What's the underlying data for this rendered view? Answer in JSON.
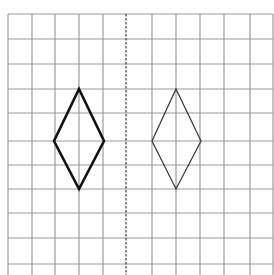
{
  "diagram": {
    "type": "grid-symmetry",
    "colors": {
      "grid": "#9a9a9a",
      "axis": "#555555",
      "shape_bold": "#111111",
      "shape_thin": "#333333",
      "background": "#ffffff"
    },
    "grid": {
      "columns_x": [
        8,
        32,
        55,
        79,
        103,
        126,
        152,
        176,
        200,
        224,
        250,
        273
      ],
      "rows_y": [
        14,
        39,
        64,
        89,
        113,
        141,
        165,
        189,
        213,
        238,
        264
      ],
      "top": 14,
      "bottom": 275,
      "left": 8,
      "right": 273
    },
    "axis_of_symmetry": {
      "x": 126,
      "style": "dashed"
    },
    "shapes": [
      {
        "name": "left-rhombus",
        "stroke_width": 2.6,
        "points": [
          [
            79,
            89
          ],
          [
            104,
            141
          ],
          [
            79,
            189
          ],
          [
            54,
            141
          ]
        ]
      },
      {
        "name": "right-rhombus",
        "stroke_width": 1.2,
        "points": [
          [
            176,
            89
          ],
          [
            201,
            141
          ],
          [
            176,
            189
          ],
          [
            152,
            141
          ]
        ]
      }
    ]
  }
}
